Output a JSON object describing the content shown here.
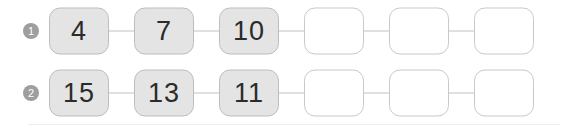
{
  "worksheet": {
    "title": "Number sequence fill-in exercise",
    "rows": [
      {
        "marker": "1",
        "marker_icon": "numbered-bullet-circle-icon",
        "cells": [
          {
            "value": "4",
            "state": "filled"
          },
          {
            "value": "7",
            "state": "filled"
          },
          {
            "value": "10",
            "state": "filled"
          },
          {
            "value": "",
            "state": "empty"
          },
          {
            "value": "",
            "state": "empty"
          },
          {
            "value": "",
            "state": "empty"
          }
        ]
      },
      {
        "marker": "2",
        "marker_icon": "numbered-bullet-circle-icon",
        "cells": [
          {
            "value": "15",
            "state": "filled"
          },
          {
            "value": "13",
            "state": "filled"
          },
          {
            "value": "11",
            "state": "filled"
          },
          {
            "value": "",
            "state": "empty"
          },
          {
            "value": "",
            "state": "empty"
          },
          {
            "value": "",
            "state": "empty"
          }
        ]
      }
    ]
  },
  "colors": {
    "filled_cell_background": "#e4e4e4",
    "filled_cell_border": "#bdbdbd",
    "empty_cell_background": "#ffffff",
    "empty_cell_border": "#c9c9c9",
    "connector_line": "#c2c2c2",
    "bullet_background": "#9e9e9e",
    "bullet_text": "#ffffff",
    "cell_text": "#2b2b2b",
    "page_background": "#ffffff",
    "bottom_rule": "#ededed"
  }
}
